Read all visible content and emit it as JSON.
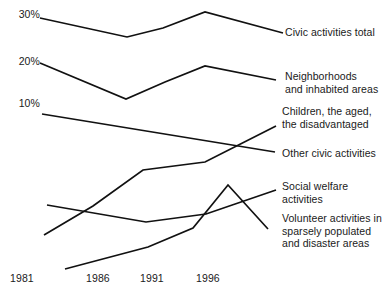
{
  "chart_data": {
    "type": "line",
    "title": "",
    "subtitle": "",
    "xlabel": "",
    "ylabel": "",
    "x": [
      1981,
      1986,
      1991,
      1996,
      2001
    ],
    "xtick_labels": [
      "1981",
      "1986",
      "1991",
      "1996"
    ],
    "ytick_labels": [
      "30%",
      "20%",
      "10%"
    ],
    "yticks": [
      30,
      20,
      10
    ],
    "ylim": [
      0,
      35
    ],
    "grid": false,
    "legend_position": "right-inline-labels",
    "series": [
      {
        "name": "Civic activities total",
        "label": "Civic activities total",
        "values": [
          30.0,
          26.0,
          29.0,
          31.5,
          27.0
        ]
      },
      {
        "name": "Neighborhoods and inhabited areas",
        "label": "Neighborhoods\nand inhabited areas",
        "values": [
          20.0,
          12.2,
          16.0,
          19.3,
          16.8
        ]
      },
      {
        "name": "Other civic activities",
        "label": "Other civic activities",
        "values": [
          8.9,
          7.2,
          5.6,
          4.6,
          4.0
        ]
      },
      {
        "name": "Children, the aged, the disadvantaged",
        "label": "Children, the aged,\nthe disadvantaged",
        "values": [
          1.0,
          3.0,
          5.3,
          6.1,
          8.1
        ]
      },
      {
        "name": "Social welfare activities",
        "label": "Social welfare activities",
        "values": [
          3.8,
          3.1,
          2.6,
          3.2,
          4.2
        ]
      },
      {
        "name": "Volunteer activities in sparsely populated and disaster areas",
        "label": "Volunteer activities in\nsparsely populated\nand disaster areas",
        "values": [
          0.2,
          1.2,
          2.0,
          4.6,
          1.2
        ]
      }
    ],
    "line_color": "#111111",
    "background_color": "#ffffff"
  },
  "geometry": {
    "ylabels": [
      {
        "text": "30%",
        "x": 4,
        "y": 8
      },
      {
        "text": "20%",
        "x": 4,
        "y": 55
      },
      {
        "text": "10%",
        "x": 4,
        "y": 97
      }
    ],
    "xlabels": [
      {
        "text": "1981",
        "x": 10,
        "y": 272
      },
      {
        "text": "1986",
        "x": 86,
        "y": 272
      },
      {
        "text": "1991",
        "x": 140,
        "y": 272
      },
      {
        "text": "1996",
        "x": 196,
        "y": 272
      }
    ],
    "legend": [
      {
        "key": "civic-activities-total",
        "x": 285,
        "y": 26
      },
      {
        "key": "neighborhoods",
        "x": 285,
        "y": 70
      },
      {
        "key": "children-aged-disadvantaged",
        "x": 282,
        "y": 105
      },
      {
        "key": "other-civic-activities",
        "x": 282,
        "y": 147
      },
      {
        "key": "social-welfare-activities",
        "x": 282,
        "y": 180
      },
      {
        "key": "volunteer-activities",
        "x": 282,
        "y": 212
      }
    ],
    "polylines": {
      "civic-activities-total": "40,18 127,37 163,28 205,12 283,33",
      "neighborhoods": "40,63 126,99 165,82 205,66 276,80",
      "other-civic-activities": "42,114 275,152",
      "children-aged-disadvantaged": "44,235 93,206 143,170 205,162 276,126",
      "social-welfare-activities": "47,205 146,222 206,214 276,190",
      "volunteer-activities": "65,269 148,247 193,228 228,185 268,229"
    }
  }
}
